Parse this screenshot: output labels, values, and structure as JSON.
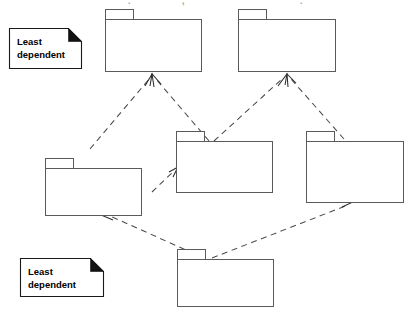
{
  "diagram": {
    "kind": "uml-package-dependency-diagram",
    "background_color": "#ffffff",
    "line_color": "#5a5a5a",
    "dashed_line_color": "#4a4a4a",
    "note_fold_color": "#111111",
    "text_color": "#000000",
    "top_clipped_text": ". ,",
    "notes": [
      {
        "id": "least-dependent",
        "line1": "Least",
        "line2": "dependent"
      },
      {
        "id": "most-dependent",
        "line1": "Most",
        "line2": "dependent"
      }
    ],
    "packages": [
      {
        "id": "pkg-top-left",
        "label": ""
      },
      {
        "id": "pkg-top-right",
        "label": ""
      },
      {
        "id": "pkg-mid-left",
        "label": ""
      },
      {
        "id": "pkg-mid-center",
        "label": ""
      },
      {
        "id": "pkg-mid-right",
        "label": ""
      },
      {
        "id": "pkg-bottom-center",
        "label": ""
      }
    ],
    "dependencies": [
      {
        "from": "pkg-mid-left",
        "to": "pkg-top-left"
      },
      {
        "from": "pkg-mid-center",
        "to": "pkg-top-left"
      },
      {
        "from": "pkg-mid-center",
        "to": "pkg-top-right"
      },
      {
        "from": "pkg-mid-right",
        "to": "pkg-top-right"
      },
      {
        "from": "pkg-mid-left",
        "to": "pkg-mid-center"
      },
      {
        "from": "pkg-bottom-center",
        "to": "pkg-mid-left"
      },
      {
        "from": "pkg-bottom-center",
        "to": "pkg-mid-right"
      }
    ]
  }
}
